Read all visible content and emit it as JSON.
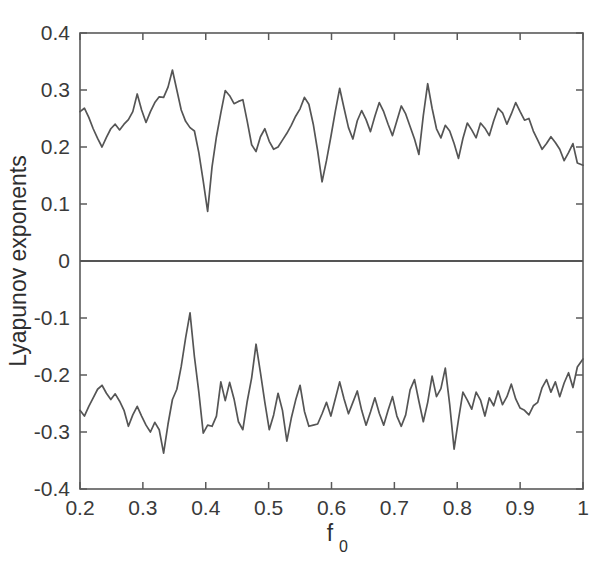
{
  "chart_data": {
    "type": "line",
    "title": "",
    "xlabel": "f_0",
    "xlabel_base": "f",
    "xlabel_sub": "0",
    "ylabel": "Lyapunov exponents",
    "xlim": [
      0.2,
      1.0
    ],
    "ylim": [
      -0.4,
      0.4
    ],
    "xticks": [
      0.2,
      0.3,
      0.4,
      0.5,
      0.6,
      0.7,
      0.8,
      0.9,
      1.0
    ],
    "xticklabels": [
      "0.2",
      "0.3",
      "0.4",
      "0.5",
      "0.6",
      "0.7",
      "0.8",
      "0.9",
      "1"
    ],
    "yticks": [
      -0.4,
      -0.3,
      -0.2,
      -0.1,
      0,
      0.1,
      0.2,
      0.3,
      0.4
    ],
    "yticklabels": [
      "-0.4",
      "-0.3",
      "-0.2",
      "-0.1",
      "0",
      "0.1",
      "0.2",
      "0.3",
      "0.4"
    ],
    "grid": false,
    "legend": null,
    "line_color": "#555555",
    "frame_color": "#5a5a5a",
    "background": "#ffffff",
    "x": [
      0.2,
      0.207,
      0.214,
      0.221,
      0.228,
      0.235,
      0.242,
      0.249,
      0.256,
      0.263,
      0.27,
      0.277,
      0.284,
      0.291,
      0.298,
      0.305,
      0.312,
      0.319,
      0.326,
      0.333,
      0.34,
      0.347,
      0.354,
      0.361,
      0.368,
      0.375,
      0.382,
      0.389,
      0.396,
      0.403,
      0.41,
      0.417,
      0.424,
      0.431,
      0.438,
      0.445,
      0.452,
      0.459,
      0.466,
      0.473,
      0.48,
      0.487,
      0.494,
      0.501,
      0.508,
      0.515,
      0.522,
      0.529,
      0.536,
      0.543,
      0.55,
      0.557,
      0.564,
      0.571,
      0.578,
      0.585,
      0.592,
      0.599,
      0.606,
      0.613,
      0.62,
      0.627,
      0.634,
      0.641,
      0.648,
      0.655,
      0.662,
      0.669,
      0.676,
      0.683,
      0.69,
      0.697,
      0.704,
      0.711,
      0.718,
      0.725,
      0.732,
      0.739,
      0.746,
      0.753,
      0.76,
      0.767,
      0.774,
      0.781,
      0.788,
      0.795,
      0.802,
      0.809,
      0.816,
      0.823,
      0.83,
      0.837,
      0.844,
      0.851,
      0.858,
      0.865,
      0.872,
      0.879,
      0.886,
      0.893,
      0.9,
      0.907,
      0.914,
      0.921,
      0.928,
      0.935,
      0.942,
      0.949,
      0.956,
      0.963,
      0.97,
      0.977,
      0.984,
      0.991,
      1.0
    ],
    "series": [
      {
        "name": "positive Lyapunov exponent",
        "values": [
          0.262,
          0.268,
          0.252,
          0.232,
          0.215,
          0.2,
          0.217,
          0.232,
          0.24,
          0.23,
          0.24,
          0.248,
          0.262,
          0.293,
          0.265,
          0.243,
          0.262,
          0.278,
          0.288,
          0.287,
          0.305,
          0.335,
          0.3,
          0.265,
          0.245,
          0.234,
          0.228,
          0.19,
          0.14,
          0.087,
          0.165,
          0.218,
          0.26,
          0.299,
          0.29,
          0.276,
          0.28,
          0.283,
          0.245,
          0.204,
          0.192,
          0.218,
          0.232,
          0.21,
          0.196,
          0.2,
          0.212,
          0.224,
          0.238,
          0.254,
          0.267,
          0.287,
          0.275,
          0.24,
          0.193,
          0.139,
          0.176,
          0.218,
          0.262,
          0.303,
          0.268,
          0.234,
          0.214,
          0.246,
          0.264,
          0.248,
          0.227,
          0.254,
          0.278,
          0.262,
          0.24,
          0.22,
          0.246,
          0.272,
          0.258,
          0.236,
          0.214,
          0.187,
          0.255,
          0.311,
          0.268,
          0.232,
          0.216,
          0.238,
          0.228,
          0.206,
          0.18,
          0.215,
          0.242,
          0.23,
          0.216,
          0.242,
          0.233,
          0.22,
          0.246,
          0.268,
          0.26,
          0.24,
          0.258,
          0.278,
          0.262,
          0.247,
          0.25,
          0.228,
          0.212,
          0.196,
          0.206,
          0.218,
          0.208,
          0.196,
          0.176,
          0.19,
          0.206,
          0.172,
          0.168
        ]
      },
      {
        "name": "zero Lyapunov exponent",
        "values": [
          0.0,
          0.0,
          0.0,
          0.0,
          0.0,
          0.0,
          0.0,
          0.0,
          0.0,
          0.0,
          0.0,
          0.0,
          0.0,
          0.0,
          0.0,
          0.0,
          0.0,
          0.0,
          0.0,
          0.0,
          0.0,
          0.0,
          0.0,
          0.0,
          0.0,
          0.0,
          0.0,
          0.0,
          0.0,
          0.0,
          0.0,
          0.0,
          0.0,
          0.0,
          0.0,
          0.0,
          0.0,
          0.0,
          0.0,
          0.0,
          0.0,
          0.0,
          0.0,
          0.0,
          0.0,
          0.0,
          0.0,
          0.0,
          0.0,
          0.0,
          0.0,
          0.0,
          0.0,
          0.0,
          0.0,
          0.0,
          0.0,
          0.0,
          0.0,
          0.0,
          0.0,
          0.0,
          0.0,
          0.0,
          0.0,
          0.0,
          0.0,
          0.0,
          0.0,
          0.0,
          0.0,
          0.0,
          0.0,
          0.0,
          0.0,
          0.0,
          0.0,
          0.0,
          0.0,
          0.0,
          0.0,
          0.0,
          0.0,
          0.0,
          0.0,
          0.0,
          0.0,
          0.0,
          0.0,
          0.0,
          0.0,
          0.0,
          0.0,
          0.0,
          0.0,
          0.0,
          0.0,
          0.0,
          0.0,
          0.0,
          0.0,
          0.0,
          0.0,
          0.0,
          0.0,
          0.0,
          0.0,
          0.0,
          0.0,
          0.0,
          0.0,
          0.0,
          0.0,
          0.0,
          0.0
        ]
      },
      {
        "name": "negative Lyapunov exponent",
        "values": [
          -0.262,
          -0.272,
          -0.255,
          -0.24,
          -0.225,
          -0.218,
          -0.232,
          -0.243,
          -0.233,
          -0.246,
          -0.262,
          -0.29,
          -0.27,
          -0.255,
          -0.272,
          -0.288,
          -0.3,
          -0.283,
          -0.296,
          -0.337,
          -0.286,
          -0.243,
          -0.225,
          -0.185,
          -0.135,
          -0.091,
          -0.168,
          -0.23,
          -0.302,
          -0.288,
          -0.29,
          -0.272,
          -0.212,
          -0.245,
          -0.213,
          -0.242,
          -0.282,
          -0.296,
          -0.246,
          -0.205,
          -0.146,
          -0.196,
          -0.248,
          -0.296,
          -0.27,
          -0.232,
          -0.262,
          -0.316,
          -0.276,
          -0.244,
          -0.218,
          -0.264,
          -0.29,
          -0.288,
          -0.286,
          -0.268,
          -0.248,
          -0.272,
          -0.242,
          -0.212,
          -0.242,
          -0.268,
          -0.248,
          -0.228,
          -0.262,
          -0.288,
          -0.265,
          -0.24,
          -0.267,
          -0.288,
          -0.262,
          -0.238,
          -0.272,
          -0.29,
          -0.27,
          -0.226,
          -0.208,
          -0.246,
          -0.282,
          -0.248,
          -0.202,
          -0.238,
          -0.224,
          -0.188,
          -0.252,
          -0.33,
          -0.278,
          -0.23,
          -0.244,
          -0.26,
          -0.23,
          -0.244,
          -0.272,
          -0.24,
          -0.254,
          -0.228,
          -0.252,
          -0.238,
          -0.216,
          -0.242,
          -0.258,
          -0.262,
          -0.27,
          -0.254,
          -0.248,
          -0.222,
          -0.208,
          -0.23,
          -0.212,
          -0.238,
          -0.214,
          -0.196,
          -0.222,
          -0.186,
          -0.172
        ]
      }
    ]
  },
  "axes": {
    "ylabel_display": "Lyapunov exponents"
  }
}
